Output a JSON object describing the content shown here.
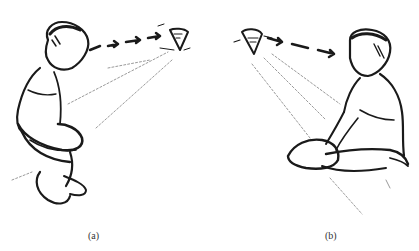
{
  "figure": {
    "panels": [
      {
        "id": "a",
        "caption": "(a)",
        "description": "Child sitting crouched, looking right at a spinning top; dashed gaze arrow from child's eyes to the top, faint sight lines below",
        "figure_icon": "child-sitting-icon",
        "object_icon": "spinning-top-icon"
      },
      {
        "id": "b",
        "caption": "(b)",
        "description": "Child sitting on floor, looking left at a spinning top; dashed gaze arrow from the top toward child's eyes, faint sight lines below",
        "figure_icon": "child-sitting-icon",
        "object_icon": "spinning-top-icon"
      }
    ],
    "colors": {
      "ink": "#1a1a1a",
      "faint": "#9a9a9a",
      "background": "#ffffff"
    }
  }
}
